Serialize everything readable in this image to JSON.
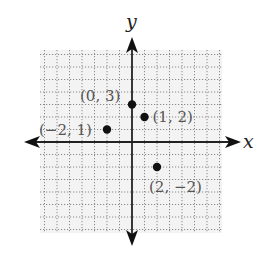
{
  "chart_data": {
    "type": "scatter",
    "title": "",
    "xlabel": "x",
    "ylabel": "y",
    "xlim": [
      -7,
      7
    ],
    "ylim": [
      -7,
      7
    ],
    "grid": true,
    "grid_style": "dotted",
    "tick_labels_shown": false,
    "points": [
      {
        "x": 0,
        "y": 3,
        "label": "(0, 3)"
      },
      {
        "x": 1,
        "y": 2,
        "label": "(1, 2)"
      },
      {
        "x": -2,
        "y": 1,
        "label": "(−2, 1)"
      },
      {
        "x": 2,
        "y": -2,
        "label": "(2, −2)"
      }
    ]
  },
  "axes": {
    "x_label": "x",
    "y_label": "y"
  },
  "colors": {
    "background": "#ffffff",
    "grid_fill": "#f3f3f3",
    "grid_line": "#8a8a8a",
    "axis": "#222222",
    "point": "#111111",
    "label": "#555555"
  }
}
